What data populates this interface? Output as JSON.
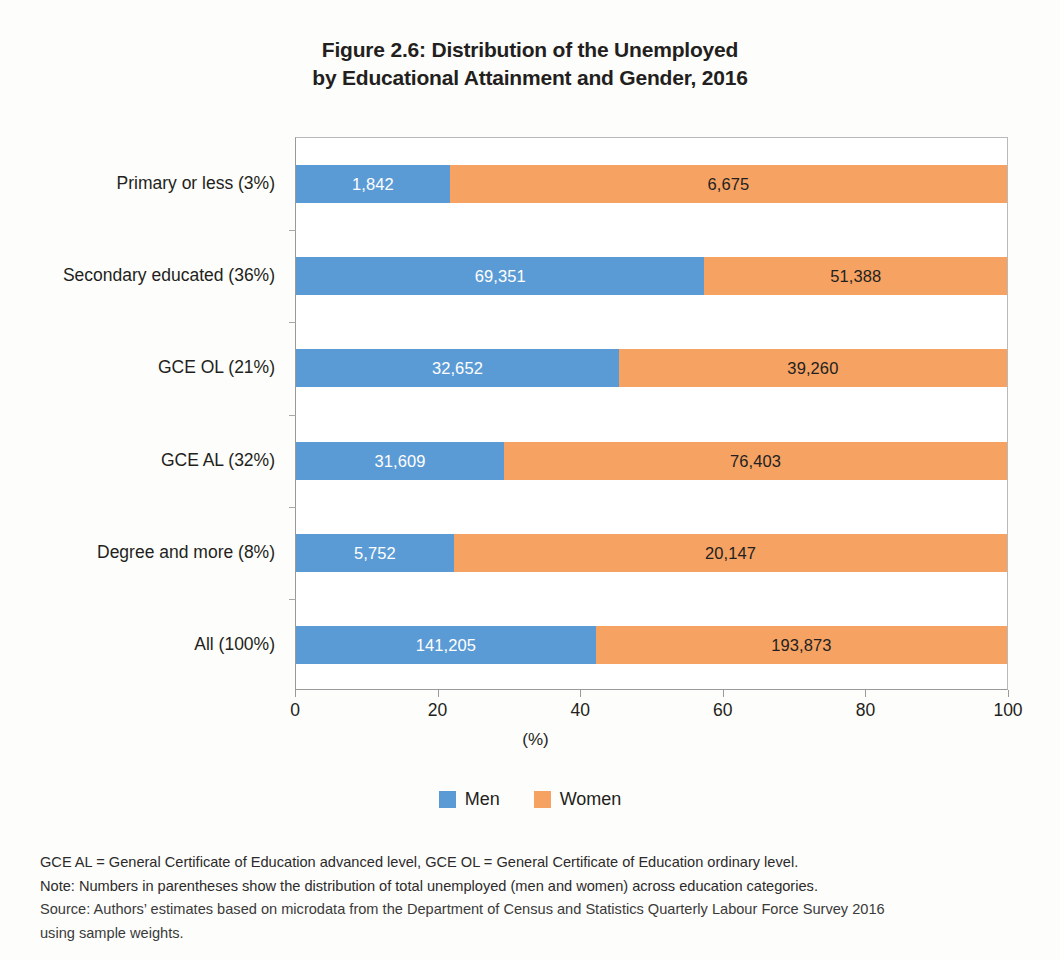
{
  "figure": {
    "title_line1": "Figure 2.6: Distribution of the Unemployed",
    "title_line2": "by Educational Attainment and Gender, 2016"
  },
  "legend": {
    "position": "bottom-center",
    "items": [
      {
        "label": "Men",
        "color": "#5B9BD5",
        "icon": "legend-swatch-men"
      },
      {
        "label": "Women",
        "color": "#F5A263",
        "icon": "legend-swatch-women"
      }
    ]
  },
  "footnotes": {
    "line1": "GCE AL = General Certificate of Education advanced level, GCE OL = General Certificate of Education ordinary level.",
    "line2": "Note: Numbers in parentheses show the distribution of total unemployed (men and women) across education categories.",
    "line3": "Source: Authors’ estimates based on microdata from the Department of Census and Statistics Quarterly Labour Force Survey 2016",
    "line4": "using sample weights."
  },
  "chart_data": {
    "type": "bar",
    "orientation": "horizontal",
    "stacked": true,
    "normalized": true,
    "title": "Figure 2.6: Distribution of the Unemployed by Educational Attainment and Gender, 2016",
    "subtitle": "",
    "xlabel": "(%)",
    "ylabel": "",
    "xlim": [
      0,
      100
    ],
    "xticks": [
      0,
      20,
      40,
      60,
      80,
      100
    ],
    "xtick_labels": [
      "0",
      "20",
      "40",
      "60",
      "80",
      "100"
    ],
    "grid": false,
    "legend_position": "bottom-center",
    "categories": [
      "Primary or less (3%)",
      "Secondary educated (36%)",
      "GCE OL (21%)",
      "GCE AL (32%)",
      "Degree and more (8%)",
      "All (100%)"
    ],
    "category_share_of_total_percent": [
      3,
      36,
      21,
      32,
      8,
      100
    ],
    "series": [
      {
        "name": "Men",
        "color": "#5B9BD5",
        "values": [
          1842,
          69351,
          32652,
          31609,
          5752,
          141205
        ],
        "labels": [
          "1,842",
          "69,351",
          "32,652",
          "31,609",
          "5,752",
          "141,205"
        ],
        "percent_of_row": [
          21.6,
          57.4,
          45.4,
          29.3,
          22.2,
          42.1
        ]
      },
      {
        "name": "Women",
        "color": "#F5A263",
        "values": [
          6675,
          51388,
          39260,
          76403,
          20147,
          193873
        ],
        "labels": [
          "6,675",
          "51,388",
          "39,260",
          "76,403",
          "20,147",
          "193,873"
        ],
        "percent_of_row": [
          78.4,
          42.6,
          54.6,
          70.7,
          77.8,
          57.9
        ]
      }
    ],
    "row_totals": [
      8517,
      120739,
      71912,
      108012,
      25899,
      335078
    ]
  }
}
